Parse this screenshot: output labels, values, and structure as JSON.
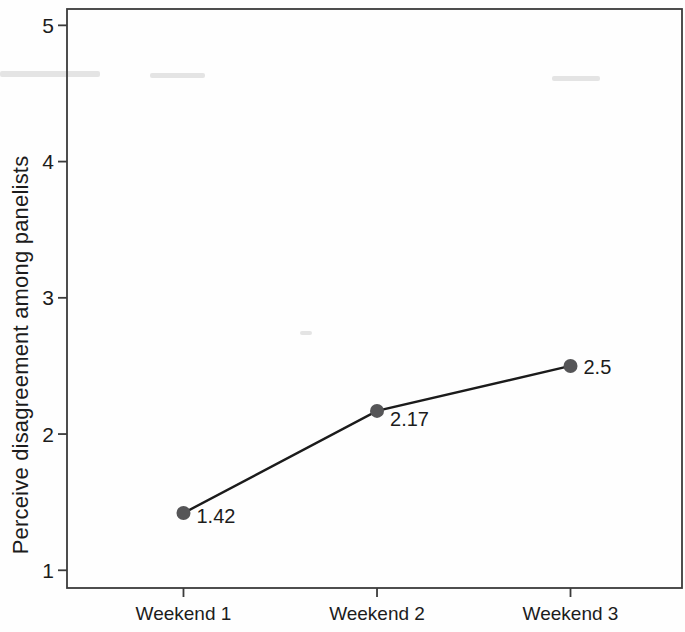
{
  "chart_data": {
    "type": "line",
    "categories": [
      "Weekend 1",
      "Weekend 2",
      "Weekend 3"
    ],
    "values": [
      1.42,
      2.17,
      2.5
    ],
    "point_labels": [
      "1.42",
      "2.17",
      "2.5"
    ],
    "title": "",
    "xlabel": "",
    "ylabel": "Perceive disagreement among panelists",
    "yticks": [
      1,
      2,
      3,
      4,
      5
    ],
    "ylim": [
      0.87,
      5.12
    ],
    "grid": false,
    "legend": "none",
    "colors": {
      "line": "#1b1b1b",
      "marker": "#555557",
      "axis": "#3b3b3b",
      "text": "#1c1c1c",
      "background": "#fefefe",
      "scan_artifact": "#b5b5b5"
    }
  }
}
